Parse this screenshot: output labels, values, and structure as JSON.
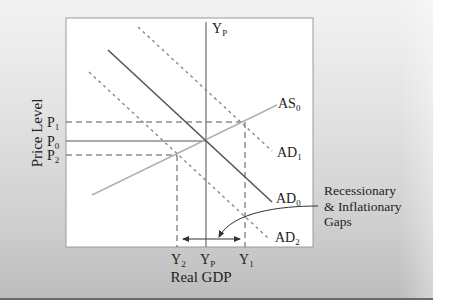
{
  "diagram": {
    "type": "AS-AD model",
    "y_axis_label": "Price Level",
    "x_axis_label": "Real GDP",
    "potential_output_label": {
      "main": "Y",
      "sub": "P"
    },
    "curves": {
      "as0": {
        "main": "AS",
        "sub": "0"
      },
      "ad0": {
        "main": "AD",
        "sub": "0"
      },
      "ad1": {
        "main": "AD",
        "sub": "1"
      },
      "ad2": {
        "main": "AD",
        "sub": "2"
      }
    },
    "price_ticks": {
      "p1": {
        "main": "P",
        "sub": "1"
      },
      "p0": {
        "main": "P",
        "sub": "0"
      },
      "p2": {
        "main": "P",
        "sub": "2"
      }
    },
    "output_ticks": {
      "y2": {
        "main": "Y",
        "sub": "2"
      },
      "yp": {
        "main": "Y",
        "sub": "P"
      },
      "y1": {
        "main": "Y",
        "sub": "1"
      }
    },
    "annotation": {
      "line1": "Recessionary",
      "line2": "& Inflationary",
      "line3": "Gaps"
    }
  },
  "colors": {
    "ad0": "#555555",
    "ad_shift": "#8a8a8a",
    "as": "#b0b0b0",
    "guides": "#555555",
    "panel_bottom": "#6a6a6a"
  }
}
